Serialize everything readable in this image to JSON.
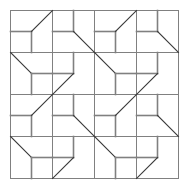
{
  "figure": {
    "background_color": "#ffffff",
    "width": 189,
    "height": 190
  },
  "chart_data": {
    "type": "diagram",
    "title": "",
    "subtitle": "",
    "xlabel": "",
    "ylabel": "",
    "grid": true,
    "legend": null,
    "annotations": [],
    "geometry": {
      "origin_x": 10,
      "origin_y": 10,
      "cell_size": 42,
      "columns": 4,
      "rows": 4,
      "frame_width": 168,
      "frame_height": 168
    },
    "style": {
      "frame_color": "#808080",
      "frame_width": 1,
      "orthogonal_color": "#808080",
      "orthogonal_width": 1.6,
      "diagonal_color": "#3a3a3a",
      "diagonal_width": 1.1
    },
    "cell_types": {
      "A": {
        "name": "mid-left-stem-down-diag-to-top-right",
        "segments": [
          {
            "kind": "orthogonal",
            "x1": 0,
            "y1": 0.5,
            "x2": 0.5,
            "y2": 0.5
          },
          {
            "kind": "orthogonal",
            "x1": 0.5,
            "y1": 0.5,
            "x2": 0.5,
            "y2": 1
          },
          {
            "kind": "diagonal",
            "x1": 0.5,
            "y1": 0.5,
            "x2": 1,
            "y2": 0
          }
        ]
      },
      "B": {
        "name": "top-stem-mid-left-diag-to-bottom-right",
        "segments": [
          {
            "kind": "orthogonal",
            "x1": 0.5,
            "y1": 0,
            "x2": 0.5,
            "y2": 0.5
          },
          {
            "kind": "orthogonal",
            "x1": 0,
            "y1": 0.5,
            "x2": 0.5,
            "y2": 0.5
          },
          {
            "kind": "diagonal",
            "x1": 0.5,
            "y1": 0.5,
            "x2": 1,
            "y2": 1
          }
        ]
      },
      "C": {
        "name": "diag-from-top-left-mid-right-stem-down",
        "segments": [
          {
            "kind": "diagonal",
            "x1": 0,
            "y1": 0,
            "x2": 0.5,
            "y2": 0.5
          },
          {
            "kind": "orthogonal",
            "x1": 0.5,
            "y1": 0.5,
            "x2": 1,
            "y2": 0.5
          },
          {
            "kind": "orthogonal",
            "x1": 0.5,
            "y1": 0.5,
            "x2": 0.5,
            "y2": 1
          }
        ]
      },
      "D": {
        "name": "top-stem-mid-left-diag-to-bottom-left",
        "segments": [
          {
            "kind": "orthogonal",
            "x1": 0.5,
            "y1": 0,
            "x2": 0.5,
            "y2": 0.5
          },
          {
            "kind": "orthogonal",
            "x1": 0,
            "y1": 0.5,
            "x2": 0.5,
            "y2": 0.5
          },
          {
            "kind": "diagonal",
            "x1": 0.5,
            "y1": 0.5,
            "x2": 0,
            "y2": 1
          }
        ]
      }
    },
    "grid_layout": [
      [
        "A",
        "B",
        "A",
        "B"
      ],
      [
        "C",
        "D",
        "C",
        "D"
      ],
      [
        "A",
        "B",
        "A",
        "B"
      ],
      [
        "C",
        "D",
        "C",
        "D"
      ]
    ]
  }
}
